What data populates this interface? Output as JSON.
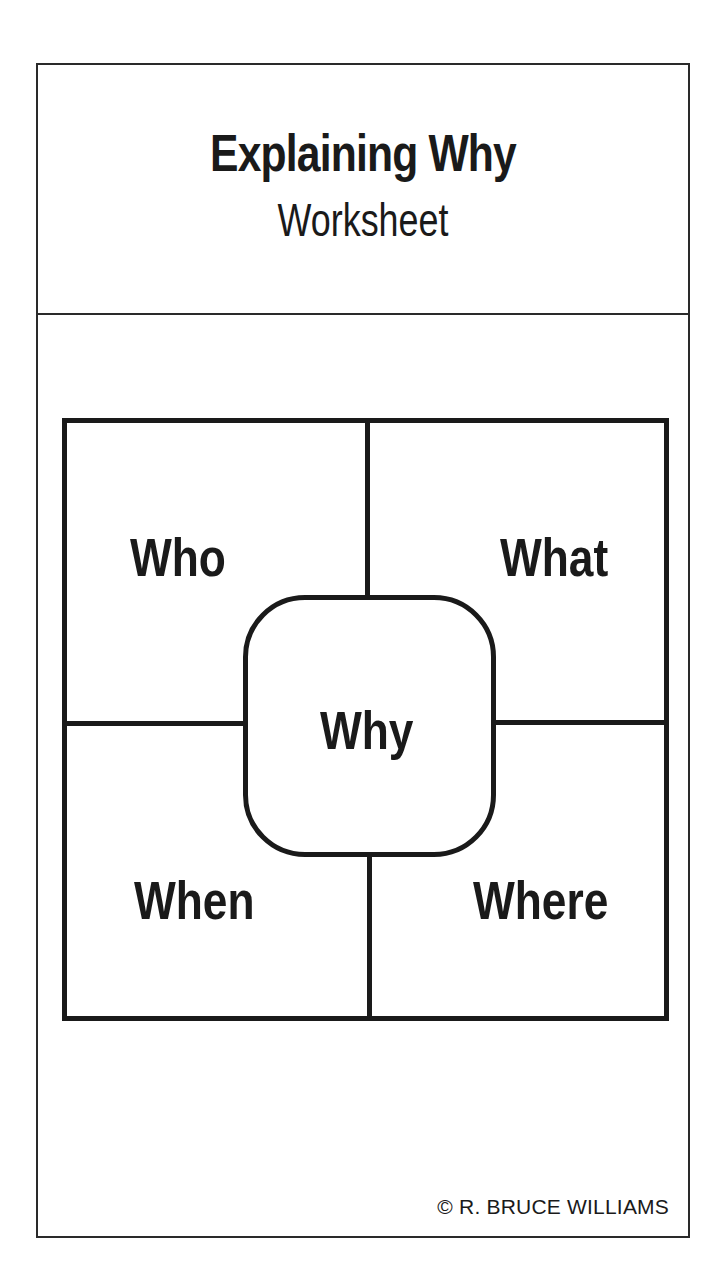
{
  "header": {
    "title": "Explaining Why",
    "subtitle": "Worksheet"
  },
  "quadrants": {
    "top_left": "Who",
    "top_right": "What",
    "bottom_left": "When",
    "bottom_right": "Where",
    "center": "Why"
  },
  "footer": {
    "copyright": "© R. BRUCE WILLIAMS"
  }
}
